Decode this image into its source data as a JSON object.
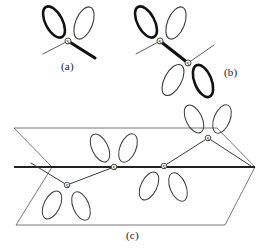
{
  "figure": {
    "caption_a": "(a)",
    "caption_b": "(b)",
    "caption_c": "(c)",
    "atom_symbol": "S",
    "colors": {
      "background": "#ffffff",
      "stroke_thin": "#3a3a3a",
      "stroke_bold": "#111111",
      "plane_edge": "#555555",
      "label_text": "#1a1a1a"
    },
    "panels": [
      {
        "id": "a",
        "label": "(a)",
        "description": "single sulfur atom with two p-orbital lobes pointing up and two bonds pointing down",
        "atoms": [
          {
            "symbol": "S",
            "x": 68,
            "y": 41,
            "lobes": [
              {
                "name": "lobe-up-left",
                "angle": -125,
                "weight": "bold"
              },
              {
                "name": "lobe-up-right",
                "angle": -55,
                "weight": "thin"
              }
            ],
            "bonds": [
              {
                "name": "bond-down-left",
                "angle": 152,
                "length": 28,
                "weight": "thin"
              },
              {
                "name": "bond-down-right",
                "angle": 33,
                "length": 32,
                "weight": "bold"
              }
            ]
          }
        ]
      },
      {
        "id": "b",
        "label": "(b)",
        "description": "two sulfur atoms joined by a bold bond, upper lobes up and lower lobes down",
        "atoms": [
          {
            "symbol": "S",
            "x": 160,
            "y": 41,
            "lobes": [
              {
                "name": "lobe-up-left",
                "angle": -125,
                "weight": "bold"
              },
              {
                "name": "lobe-up-right",
                "angle": -55,
                "weight": "thin"
              }
            ],
            "bonds": [
              {
                "name": "bond-down-left",
                "angle": 152,
                "length": 27,
                "weight": "thin"
              },
              {
                "name": "bond-s-s",
                "angle": 38,
                "length": 35,
                "weight": "bold"
              }
            ]
          },
          {
            "symbol": "S",
            "x": 188,
            "y": 63,
            "lobes": [
              {
                "name": "lobe-down-left",
                "angle": 125,
                "weight": "thin"
              },
              {
                "name": "lobe-down-right",
                "angle": 55,
                "weight": "bold"
              }
            ],
            "bonds": [
              {
                "name": "bond-up-right",
                "angle": -36,
                "length": 30,
                "weight": "thin"
              }
            ]
          }
        ]
      },
      {
        "id": "c",
        "label": "(c)",
        "description": "zig-zag chain of four sulfur atoms drawn inside a parallelogram representing a plane",
        "plane": {
          "name": "plane-parallelogram",
          "points": "14,128 217,128 255,167 52,167"
        },
        "chain_axis": {
          "name": "chain-axis-line",
          "x1": 14,
          "y1": 167,
          "x2": 255,
          "y2": 167
        },
        "atoms": [
          {
            "symbol": "S",
            "x": 67,
            "y": 185,
            "lobes": [
              {
                "name": "lobe-down-left",
                "angle": 118,
                "weight": "thin"
              },
              {
                "name": "lobe-down-right",
                "angle": 56,
                "weight": "thin"
              }
            ]
          },
          {
            "symbol": "S",
            "x": 114,
            "y": 167,
            "lobes": [
              {
                "name": "lobe-up-left",
                "angle": -122,
                "weight": "thin"
              },
              {
                "name": "lobe-up-right",
                "angle": -58,
                "weight": "thin"
              }
            ]
          },
          {
            "symbol": "S",
            "x": 164,
            "y": 166,
            "lobes": [
              {
                "name": "lobe-down-left",
                "angle": 118,
                "weight": "thin"
              },
              {
                "name": "lobe-down-right",
                "angle": 58,
                "weight": "thin"
              }
            ]
          },
          {
            "symbol": "S",
            "x": 208,
            "y": 138,
            "lobes": [
              {
                "name": "lobe-up-left",
                "angle": -122,
                "weight": "thin"
              },
              {
                "name": "lobe-up-right",
                "angle": -58,
                "weight": "thin"
              }
            ]
          }
        ],
        "bonds": [
          {
            "name": "bond-plane-left-to-s1",
            "x1": 31,
            "y1": 164,
            "x2": 67,
            "y2": 185
          },
          {
            "name": "bond-s1-to-s2",
            "x1": 67,
            "y1": 185,
            "x2": 114,
            "y2": 167
          },
          {
            "name": "bond-s2-to-s3",
            "x1": 114,
            "y1": 167,
            "x2": 164,
            "y2": 166
          },
          {
            "name": "bond-s3-to-s4",
            "x1": 164,
            "y1": 166,
            "x2": 208,
            "y2": 138
          },
          {
            "name": "bond-s4-to-plane-right",
            "x1": 208,
            "y1": 138,
            "x2": 250,
            "y2": 165
          }
        ]
      }
    ]
  }
}
